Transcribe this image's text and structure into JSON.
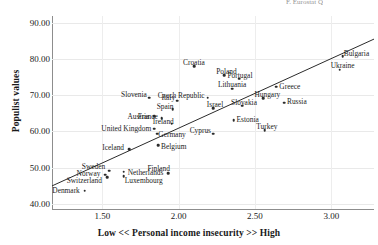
{
  "figure": {
    "top_strip_text": "F. Eurostat   Q"
  },
  "chart_data": {
    "type": "scatter",
    "title": "",
    "xlabel": "Low << Personal income insecurity >> High",
    "ylabel": "Populist values",
    "xlim": [
      1.17,
      3.28
    ],
    "ylim": [
      38.5,
      92.0
    ],
    "xticks": [
      "1.50",
      "2.00",
      "2.50",
      "3.00"
    ],
    "xtick_values": [
      1.5,
      2.0,
      2.5,
      3.0
    ],
    "yticks": [
      "40.00",
      "50.00",
      "60.00",
      "70.00",
      "80.00",
      "90.00"
    ],
    "ytick_values": [
      40,
      50,
      60,
      70,
      80,
      90
    ],
    "grid": true,
    "legend": "none",
    "points": [
      {
        "label": "Denmark",
        "x": 1.385,
        "y": 43.6,
        "lpos": "r",
        "ldx": -5,
        "ldy": 0
      },
      {
        "label": "Norway",
        "x": 1.52,
        "y": 48.0,
        "lpos": "r",
        "ldx": -5,
        "ldy": -0.5
      },
      {
        "label": "Sweden",
        "x": 1.545,
        "y": 49.1,
        "lpos": "r",
        "ldx": -4,
        "ldy": -4.2
      },
      {
        "label": "Switzerland",
        "x": 1.53,
        "y": 47.3,
        "lpos": "r",
        "ldx": -5,
        "ldy": 3.6
      },
      {
        "label": "Netherlands",
        "x": 1.64,
        "y": 48.8,
        "lpos": "l",
        "ldx": 4,
        "ldy": 1.3
      },
      {
        "label": "Luxembourg",
        "x": 1.64,
        "y": 47.6,
        "lpos": "l",
        "ldx": 1,
        "ldy": 4.4
      },
      {
        "label": "Iceland",
        "x": 1.675,
        "y": 55.1,
        "lpos": "r",
        "ldx": -5,
        "ldy": -1.0
      },
      {
        "label": "Finland",
        "x": 1.93,
        "y": 48.5,
        "lpos": "r",
        "ldx": 2,
        "ldy": -4.4
      },
      {
        "label": "Belgium",
        "x": 1.865,
        "y": 56.2,
        "lpos": "l",
        "ldx": 3,
        "ldy": 1.7
      },
      {
        "label": "Germany",
        "x": 1.86,
        "y": 59.4,
        "lpos": "l",
        "ldx": 1,
        "ldy": 1.3
      },
      {
        "label": "United Kingdom",
        "x": 1.84,
        "y": 60.8,
        "lpos": "r",
        "ldx": -3,
        "ldy": 0
      },
      {
        "label": "Austria",
        "x": 1.84,
        "y": 64.2,
        "lpos": "r",
        "ldx": -5,
        "ldy": 0.4
      },
      {
        "label": "France",
        "x": 1.89,
        "y": 63.6,
        "lpos": "r",
        "ldx": -4,
        "ldy": -1.6
      },
      {
        "label": "Ireland",
        "x": 1.955,
        "y": 62.1,
        "lpos": "r",
        "ldx": 2,
        "ldy": -1.4
      },
      {
        "label": "Spain",
        "x": 1.96,
        "y": 66.2,
        "lpos": "r",
        "ldx": 1,
        "ldy": -1.8
      },
      {
        "label": "Slovenia",
        "x": 1.805,
        "y": 69.4,
        "lpos": "r",
        "ldx": -2,
        "ldy": -2.6
      },
      {
        "label": "Italy",
        "x": 1.99,
        "y": 68.5,
        "lpos": "r",
        "ldx": -2,
        "ldy": -2.4
      },
      {
        "label": "Czech Republic",
        "x": 2.19,
        "y": 69.4,
        "lpos": "r",
        "ldx": -3,
        "ldy": -2.0
      },
      {
        "label": "Croatia",
        "x": 2.1,
        "y": 78.1,
        "lpos": "c",
        "ldx": 0,
        "ldy": -3.4
      },
      {
        "label": "Cyprus",
        "x": 2.225,
        "y": 59.4,
        "lpos": "r",
        "ldx": -2,
        "ldy": -2.8
      },
      {
        "label": "Israel",
        "x": 2.225,
        "y": 66.5,
        "lpos": "c",
        "ldx": 2,
        "ldy": -2.8
      },
      {
        "label": "Poland",
        "x": 2.3,
        "y": 75.6,
        "lpos": "c",
        "ldx": 2,
        "ldy": -3.2
      },
      {
        "label": "Lithuania",
        "x": 2.35,
        "y": 71.9,
        "lpos": "c",
        "ldx": 0,
        "ldy": -3.2
      },
      {
        "label": "Portugal",
        "x": 2.395,
        "y": 74.6,
        "lpos": "c",
        "ldx": 1,
        "ldy": -3.0
      },
      {
        "label": "Estonia",
        "x": 2.36,
        "y": 63.1,
        "lpos": "l",
        "ldx": 3,
        "ldy": 0
      },
      {
        "label": "Slovakia",
        "x": 2.415,
        "y": 67.1,
        "lpos": "c",
        "ldx": 2,
        "ldy": -3.0
      },
      {
        "label": "Hungary",
        "x": 2.555,
        "y": 69.2,
        "lpos": "c",
        "ldx": 4,
        "ldy": -3.2
      },
      {
        "label": "Greece",
        "x": 2.64,
        "y": 72.4,
        "lpos": "l",
        "ldx": 3,
        "ldy": 0
      },
      {
        "label": "Turkey",
        "x": 2.565,
        "y": 60.4,
        "lpos": "c",
        "ldx": 2,
        "ldy": -3.4
      },
      {
        "label": "Russia",
        "x": 2.69,
        "y": 68.0,
        "lpos": "l",
        "ldx": 3,
        "ldy": -1.0
      },
      {
        "label": "Ukraine",
        "x": 3.055,
        "y": 77.1,
        "lpos": "c",
        "ldx": 3,
        "ldy": -3.4
      },
      {
        "label": "Bulgaria",
        "x": 3.075,
        "y": 80.9,
        "lpos": "l",
        "ldx": 1,
        "ldy": -2.2
      }
    ],
    "trendline": {
      "x0": 1.17,
      "y0": 44.9,
      "x1": 3.28,
      "y1": 85.6
    }
  }
}
